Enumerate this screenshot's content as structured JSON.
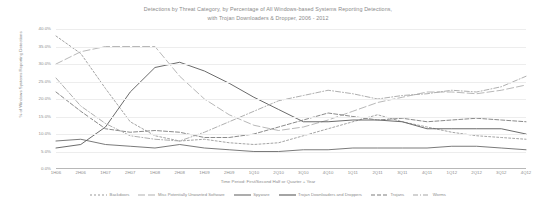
{
  "chart_data": {
    "type": "line",
    "title": "Detections by Threat Category, by Percentage of All Windows-based Systems Reporting Detections, with Trojan Downloaders & Dropper, 2006 - 2012",
    "title_line1": "Detections by Threat Category, by Percentage of All Windows-based Systems Reporting Detections,",
    "title_line2": "with Trojan Downloaders & Dropper, 2006 - 2012",
    "xlabel": "Time Period: First/Second Half or Quarter + Year",
    "ylabel": "% of Windows Systems Reporting Detections",
    "grid": true,
    "legend_position": "bottom",
    "ylim": [
      0,
      40
    ],
    "ytick_labels": [
      "40.0%",
      "35.0%",
      "30.0%",
      "25.0%",
      "20.0%",
      "15.0%",
      "10.0%",
      "5.0%",
      "0.0%"
    ],
    "ytick_values": [
      40,
      35,
      30,
      25,
      20,
      15,
      10,
      5,
      0
    ],
    "categories": [
      "1H06",
      "2H06",
      "1H07",
      "2H07",
      "1H08",
      "2H08",
      "1H09",
      "2H09",
      "1Q10",
      "2Q10",
      "3Q10",
      "4Q10",
      "1Q11",
      "2Q11",
      "3Q11",
      "4Q11",
      "1Q12",
      "2Q12",
      "3Q12",
      "4Q12"
    ],
    "series": [
      {
        "name": "Backdoors",
        "dash": "2,2",
        "color": "#9a9a9a",
        "values": [
          38.0,
          33.0,
          23.0,
          13.5,
          9.5,
          8.0,
          8.5,
          7.5,
          7.0,
          7.5,
          9.5,
          11.5,
          13.5,
          15.5,
          13.5,
          12.0,
          10.5,
          9.5,
          9.0,
          8.5
        ]
      },
      {
        "name": "Misc Potentially Unwanted Software",
        "dash": "7,3",
        "color": "#b0b0b0",
        "values": [
          30.0,
          33.5,
          35.0,
          35.0,
          35.0,
          26.5,
          20.0,
          15.5,
          12.5,
          11.0,
          12.0,
          14.0,
          16.5,
          19.0,
          20.5,
          22.0,
          22.0,
          21.5,
          22.5,
          24.0
        ]
      },
      {
        "name": "Spyware",
        "dash": "none",
        "color": "#6b6b6b",
        "values": [
          8.0,
          8.5,
          7.0,
          6.5,
          6.0,
          7.0,
          6.0,
          5.5,
          5.0,
          5.0,
          5.5,
          5.5,
          6.0,
          6.0,
          6.0,
          6.0,
          6.5,
          6.5,
          6.0,
          5.5
        ]
      },
      {
        "name": "Trojan Downloaders and Droppers",
        "dash": "none",
        "color": "#5a5a5a",
        "values": [
          6.0,
          7.0,
          12.0,
          22.0,
          29.0,
          30.5,
          28.0,
          24.5,
          20.5,
          17.0,
          13.5,
          13.5,
          14.0,
          14.0,
          13.5,
          11.5,
          11.5,
          11.5,
          11.5,
          10.0
        ]
      },
      {
        "name": "Trojans",
        "dash": "4,2",
        "color": "#7d7d7d",
        "values": [
          22.0,
          16.5,
          11.5,
          10.5,
          11.0,
          10.5,
          9.0,
          9.0,
          10.0,
          12.0,
          14.0,
          16.0,
          15.0,
          14.0,
          14.5,
          13.5,
          14.0,
          14.5,
          14.0,
          13.5
        ]
      },
      {
        "name": "Worms",
        "dash": "5,2,1,2",
        "color": "#a6a6a6",
        "values": [
          26.0,
          18.0,
          13.0,
          9.5,
          8.5,
          8.0,
          10.5,
          13.5,
          16.5,
          19.5,
          21.0,
          22.5,
          21.5,
          20.0,
          21.0,
          21.5,
          22.5,
          22.0,
          23.5,
          26.5
        ]
      }
    ]
  }
}
